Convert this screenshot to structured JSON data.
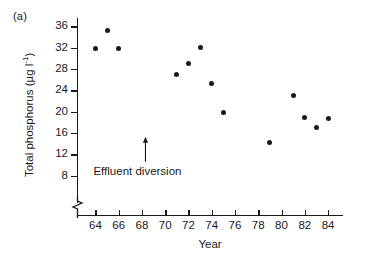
{
  "figure": {
    "panel_label": "(a)"
  },
  "annotation": {
    "label": "Effluent diversion",
    "arrow_year": 68.3,
    "arrow_base_value": 10.6,
    "arrow_tip_value": 15.3
  },
  "chart_data": {
    "type": "scatter",
    "title": "",
    "xlabel": "Year",
    "ylabel": "Total phosphorus (µg l⁻¹)",
    "ylabel_plain": "Total phosphorus (ug l-1)",
    "xlim": [
      62.5,
      85.2
    ],
    "ylim": [
      7.0,
      37.2
    ],
    "xticks": [
      64,
      66,
      68,
      70,
      72,
      74,
      76,
      78,
      80,
      82,
      84
    ],
    "xtick_labels": [
      "64",
      "66",
      "68",
      "70",
      "72",
      "74",
      "76",
      "78",
      "80",
      "82",
      "84"
    ],
    "yticks": [
      8,
      12,
      16,
      20,
      24,
      28,
      32,
      36
    ],
    "ytick_labels": [
      "8",
      "12",
      "16",
      "20",
      "24",
      "28",
      "32",
      "36"
    ],
    "grid": false,
    "legend": false,
    "axis_break": true,
    "marker": "filled-circle",
    "marker_color": "#1a1a1a",
    "x": [
      64,
      65,
      66,
      71,
      72,
      73,
      74,
      75,
      79,
      81,
      82,
      83,
      84
    ],
    "y": [
      31.8,
      35.3,
      31.8,
      26.9,
      29.1,
      32.1,
      25.2,
      19.8,
      14.2,
      23.0,
      19.0,
      17.1,
      18.8
    ],
    "points": [
      {
        "x": 64,
        "y": 31.8
      },
      {
        "x": 65,
        "y": 35.3
      },
      {
        "x": 66,
        "y": 31.8
      },
      {
        "x": 71,
        "y": 26.9
      },
      {
        "x": 72,
        "y": 29.1
      },
      {
        "x": 73,
        "y": 32.1
      },
      {
        "x": 74,
        "y": 25.2
      },
      {
        "x": 75,
        "y": 19.8
      },
      {
        "x": 79,
        "y": 14.2
      },
      {
        "x": 81,
        "y": 23.0
      },
      {
        "x": 82,
        "y": 19.0
      },
      {
        "x": 83,
        "y": 17.1
      },
      {
        "x": 84,
        "y": 18.8
      }
    ],
    "annotations": [
      {
        "text": "Effluent diversion",
        "x": 68.3,
        "y": 10.6,
        "type": "arrow-up"
      }
    ]
  }
}
